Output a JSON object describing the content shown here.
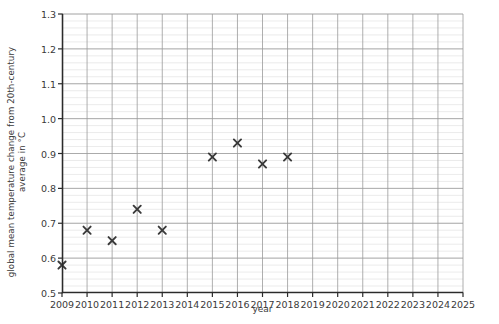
{
  "chart_data": {
    "type": "scatter",
    "title": "",
    "xlabel": "year",
    "ylabel_line1": "global mean temperature change from 20th-century",
    "ylabel_line2": "average in °C",
    "xlim": [
      2009,
      2025
    ],
    "ylim": [
      0.5,
      1.3
    ],
    "xticks": [
      2009,
      2010,
      2011,
      2012,
      2013,
      2014,
      2015,
      2016,
      2017,
      2018,
      2019,
      2020,
      2021,
      2022,
      2023,
      2024,
      2025
    ],
    "xtick_labels": [
      "2009",
      "2010",
      "2011",
      "2012",
      "2013",
      "2014",
      "2015",
      "2016",
      "2017",
      "2018",
      "2019",
      "2020",
      "2021",
      "2022",
      "2023",
      "2024",
      "2025"
    ],
    "yticks": [
      0.5,
      0.6,
      0.7,
      0.8,
      0.9,
      1.0,
      1.1,
      1.2,
      1.3
    ],
    "ytick_labels": [
      "0.5",
      "0.6",
      "0.7",
      "0.8",
      "0.9",
      "1.0",
      "1.1",
      "1.2",
      "1.3"
    ],
    "y_minor_step": 0.02,
    "grid": true,
    "grid_major_color": "#9a9a9a",
    "grid_minor_color": "#e6e6e6",
    "legend": "none",
    "marker": "x",
    "marker_color": "#3a3a3a",
    "x": [
      2009,
      2010,
      2011,
      2012,
      2013,
      2015,
      2016,
      2017,
      2018
    ],
    "values": [
      0.58,
      0.68,
      0.65,
      0.74,
      0.68,
      0.89,
      0.93,
      0.87,
      0.89
    ],
    "points": [
      {
        "year": 2009,
        "value": 0.58
      },
      {
        "year": 2010,
        "value": 0.68
      },
      {
        "year": 2011,
        "value": 0.65
      },
      {
        "year": 2012,
        "value": 0.74
      },
      {
        "year": 2013,
        "value": 0.68
      },
      {
        "year": 2015,
        "value": 0.89
      },
      {
        "year": 2016,
        "value": 0.93
      },
      {
        "year": 2017,
        "value": 0.87
      },
      {
        "year": 2018,
        "value": 0.89
      }
    ]
  }
}
